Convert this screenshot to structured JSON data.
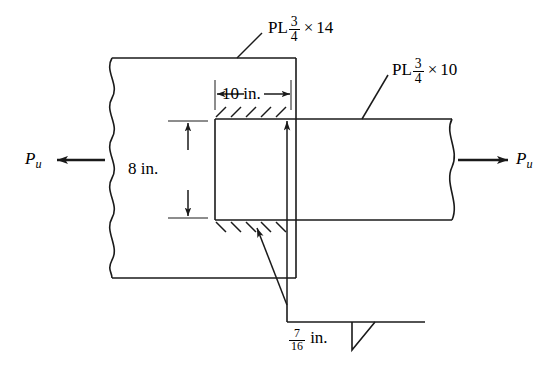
{
  "figure": {
    "stroke_color": "#1a1a1a",
    "background": "#ffffff"
  },
  "labels": {
    "main_plate": {
      "prefix": "PL",
      "numerator": "3",
      "denominator": "4",
      "times": "×",
      "width": "14"
    },
    "lap_plate": {
      "prefix": "PL",
      "numerator": "3",
      "denominator": "4",
      "times": "×",
      "width": "10"
    },
    "weld_size": {
      "numerator": "7",
      "denominator": "16",
      "unit": "in."
    },
    "dim_horizontal": "10 in.",
    "dim_vertical": "8 in.",
    "force_left": {
      "symbol": "P",
      "subscript": "u"
    },
    "force_right": {
      "symbol": "P",
      "subscript": "u"
    }
  },
  "annotations": {
    "main_plate_leader": "leader-line-main-plate",
    "lap_plate_leader": "leader-line-lap-plate",
    "weld_leader_top": "leader-line-weld-top",
    "weld_leader_bottom": "leader-line-weld-bottom",
    "weld_symbol": "fillet-weld-triangle",
    "hatch_top": "weld-hatching-top",
    "hatch_bottom": "weld-hatching-bottom",
    "break_line_left": "break-line-left",
    "break_line_right": "break-line-right"
  }
}
